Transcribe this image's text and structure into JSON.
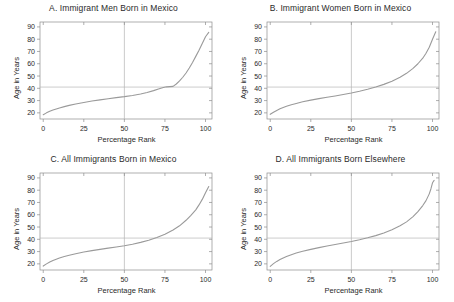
{
  "figure": {
    "axis_label_x": "Percentage Rank",
    "axis_label_y": "Age in Years",
    "line_color": "#9a9a9a",
    "ref_line_color": "#b4b4b4",
    "axis_color": "#8d8d8d"
  },
  "chart_data": [
    {
      "type": "line",
      "panel": "A",
      "title": "A.  Immigrant Men Born in Mexico",
      "xlabel": "Percentage Rank",
      "ylabel": "Age in Years",
      "xlim": [
        -2,
        104
      ],
      "ylim": [
        15,
        94
      ],
      "xticks": [
        0,
        25,
        50,
        75,
        100
      ],
      "yticks": [
        20,
        30,
        40,
        50,
        60,
        70,
        80,
        90
      ],
      "grid": false,
      "reference_lines": {
        "horizontal_y": 41,
        "vertical_x": 50
      },
      "x": [
        0,
        2,
        4,
        6,
        8,
        10,
        13,
        16,
        20,
        25,
        30,
        35,
        40,
        45,
        50,
        55,
        60,
        64,
        68,
        71,
        74,
        76,
        78,
        80,
        82,
        84,
        86,
        88,
        90,
        92,
        94,
        96,
        98,
        100,
        102
      ],
      "y": [
        18.5,
        20.0,
        21.3,
        22.3,
        23.2,
        24.0,
        25.1,
        26.1,
        27.2,
        28.5,
        29.6,
        30.6,
        31.5,
        32.4,
        33.2,
        34.2,
        35.4,
        36.6,
        38.1,
        39.4,
        40.6,
        41.2,
        41.4,
        41.6,
        43.5,
        46.0,
        49.0,
        52.5,
        56.5,
        61.0,
        66.0,
        71.0,
        76.5,
        82.0,
        85.5
      ]
    },
    {
      "type": "line",
      "panel": "B",
      "title": "B.  Immigrant Women Born in Mexico",
      "xlabel": "Percentage Rank",
      "ylabel": "Age in Years",
      "xlim": [
        -2,
        104
      ],
      "ylim": [
        15,
        94
      ],
      "xticks": [
        0,
        25,
        50,
        75,
        100
      ],
      "yticks": [
        20,
        30,
        40,
        50,
        60,
        70,
        80,
        90
      ],
      "grid": false,
      "reference_lines": {
        "horizontal_y": 41,
        "vertical_x": 50
      },
      "x": [
        0,
        2,
        4,
        6,
        8,
        10,
        13,
        16,
        20,
        25,
        30,
        35,
        40,
        45,
        50,
        55,
        60,
        65,
        70,
        75,
        80,
        84,
        88,
        91,
        94,
        96,
        98,
        100,
        102
      ],
      "y": [
        18.8,
        20.5,
        22.0,
        23.3,
        24.4,
        25.4,
        26.6,
        27.7,
        29.0,
        30.4,
        31.6,
        32.7,
        33.8,
        35.0,
        36.2,
        37.6,
        39.2,
        41.0,
        43.2,
        45.8,
        49.0,
        52.2,
        56.2,
        60.0,
        64.5,
        68.5,
        73.5,
        80.0,
        86.0
      ]
    },
    {
      "type": "line",
      "panel": "C",
      "title": "C.  All Immigrants Born in Mexico",
      "xlabel": "Percentage Rank",
      "ylabel": "Age in Years",
      "xlim": [
        -2,
        104
      ],
      "ylim": [
        15,
        94
      ],
      "xticks": [
        0,
        25,
        50,
        75,
        100
      ],
      "yticks": [
        20,
        30,
        40,
        50,
        60,
        70,
        80,
        90
      ],
      "grid": false,
      "reference_lines": {
        "horizontal_y": 41,
        "vertical_x": 50
      },
      "x": [
        0,
        2,
        4,
        6,
        8,
        10,
        13,
        16,
        20,
        25,
        30,
        35,
        40,
        45,
        50,
        55,
        60,
        65,
        70,
        75,
        80,
        84,
        88,
        91,
        94,
        96,
        98,
        100,
        102
      ],
      "y": [
        18.2,
        20.0,
        21.5,
        22.8,
        23.8,
        24.8,
        26.0,
        27.0,
        28.2,
        29.6,
        30.8,
        31.8,
        32.8,
        33.8,
        34.8,
        36.0,
        37.5,
        39.3,
        41.5,
        44.2,
        47.6,
        51.0,
        55.5,
        59.5,
        64.0,
        68.0,
        72.5,
        78.0,
        83.0
      ]
    },
    {
      "type": "line",
      "panel": "D",
      "title": "D.  All Immigrants Born Elsewhere",
      "xlabel": "Percentage Rank",
      "ylabel": "Age in Years",
      "xlim": [
        -2,
        104
      ],
      "ylim": [
        15,
        94
      ],
      "xticks": [
        0,
        25,
        50,
        75,
        100
      ],
      "yticks": [
        20,
        30,
        40,
        50,
        60,
        70,
        80,
        90
      ],
      "grid": false,
      "reference_lines": {
        "horizontal_y": 41,
        "vertical_x": 50
      },
      "x": [
        0,
        2,
        4,
        6,
        8,
        10,
        13,
        16,
        20,
        25,
        30,
        35,
        40,
        45,
        50,
        55,
        60,
        65,
        70,
        75,
        80,
        84,
        88,
        91,
        94,
        96,
        98,
        99,
        100,
        101
      ],
      "y": [
        18.0,
        20.2,
        22.0,
        23.5,
        24.8,
        26.0,
        27.5,
        28.8,
        30.2,
        31.8,
        33.2,
        34.5,
        35.8,
        37.0,
        38.2,
        39.6,
        41.2,
        43.0,
        45.2,
        47.8,
        51.0,
        54.2,
        58.5,
        62.5,
        67.5,
        71.5,
        77.0,
        81.0,
        86.0,
        88.0
      ]
    }
  ]
}
